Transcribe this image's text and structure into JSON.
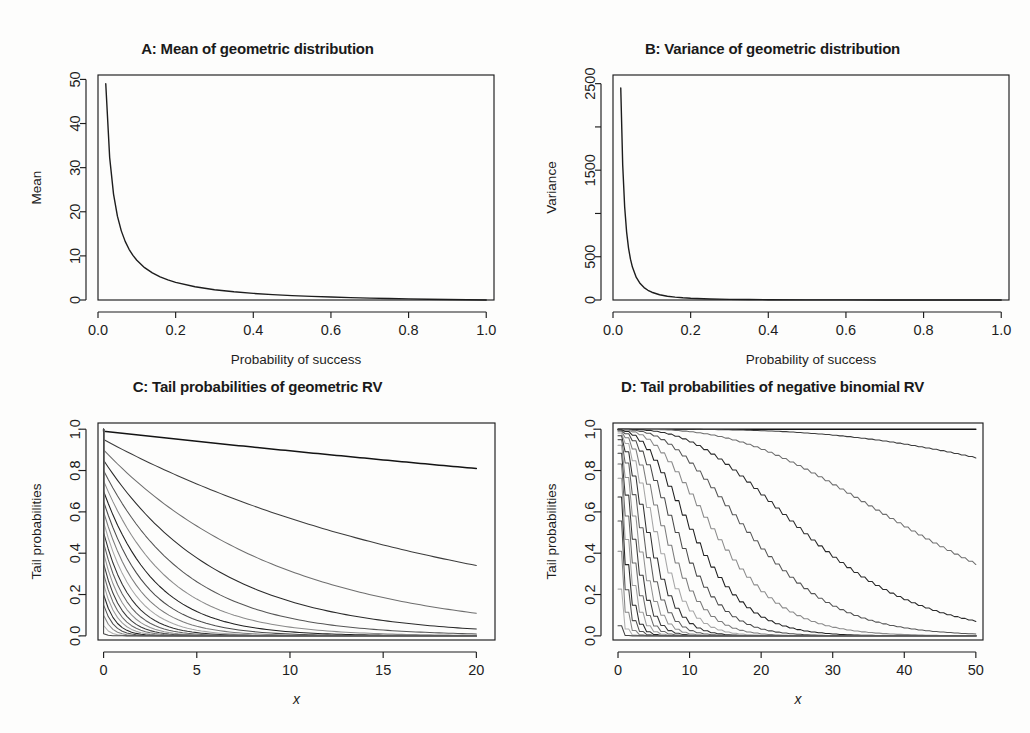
{
  "figure": {
    "background": "#fdfdfc",
    "foreground": "#1d1d1d",
    "width": 1030,
    "height": 733
  },
  "panels": [
    {
      "id": "A",
      "title": "A: Mean of geometric distribution",
      "xlabel": "Probability of success",
      "ylabel": "Mean"
    },
    {
      "id": "B",
      "title": "B: Variance of geometric distribution",
      "xlabel": "Probability of success",
      "ylabel": "Variance"
    },
    {
      "id": "C",
      "title": "C: Tail probabilities of geometric RV",
      "xlabel": "x",
      "ylabel": "Tail probabilities"
    },
    {
      "id": "D",
      "title": "D: Tail probabilities of negative binomial RV",
      "xlabel": "x",
      "ylabel": "Tail probabilities"
    }
  ],
  "chart_data": [
    {
      "panel": "A",
      "type": "line",
      "title": "A: Mean of geometric distribution",
      "xlabel": "Probability of success",
      "ylabel": "Mean",
      "xlim": [
        0.0,
        1.02
      ],
      "ylim": [
        0.0,
        51.0
      ],
      "xticks": [
        0.0,
        0.2,
        0.4,
        0.6,
        0.8,
        1.0
      ],
      "xticklabels": [
        "0.0",
        "0.2",
        "0.4",
        "0.6",
        "0.8",
        "1.0"
      ],
      "yticks": [
        0,
        10,
        20,
        30,
        40,
        50
      ],
      "yticklabels": [
        "0",
        "10",
        "20",
        "30",
        "40",
        "50"
      ],
      "grid": false,
      "legend": false,
      "formula": "mean = (1-p)/p",
      "series": [
        {
          "name": "mean of geometric",
          "color": "#1d1d1d",
          "width": 1.4,
          "x": [
            0.02,
            0.03,
            0.04,
            0.05,
            0.06,
            0.07,
            0.08,
            0.09,
            0.1,
            0.12,
            0.14,
            0.16,
            0.18,
            0.2,
            0.25,
            0.3,
            0.35,
            0.4,
            0.45,
            0.5,
            0.55,
            0.6,
            0.65,
            0.7,
            0.75,
            0.8,
            0.85,
            0.9,
            0.95,
            1.0
          ],
          "y": [
            49.0,
            32.33,
            24.0,
            19.0,
            15.67,
            13.29,
            11.5,
            10.11,
            9.0,
            7.33,
            6.14,
            5.25,
            4.56,
            4.0,
            3.0,
            2.33,
            1.857,
            1.5,
            1.222,
            1.0,
            0.818,
            0.667,
            0.538,
            0.429,
            0.333,
            0.25,
            0.176,
            0.111,
            0.053,
            0.0
          ]
        }
      ]
    },
    {
      "panel": "B",
      "type": "line",
      "title": "B: Variance of geometric distribution",
      "xlabel": "Probability of success",
      "ylabel": "Variance",
      "xlim": [
        0.0,
        1.02
      ],
      "ylim": [
        0.0,
        2600.0
      ],
      "xticks": [
        0.0,
        0.2,
        0.4,
        0.6,
        0.8,
        1.0
      ],
      "xticklabels": [
        "0.0",
        "0.2",
        "0.4",
        "0.6",
        "0.8",
        "1.0"
      ],
      "yticks": [
        0,
        500,
        1000,
        1500,
        2000,
        2500
      ],
      "yticklabels": [
        "0",
        "500",
        "",
        "1500",
        "",
        "2500"
      ],
      "grid": false,
      "legend": false,
      "formula": "variance = (1-p)/p^2",
      "series": [
        {
          "name": "variance of geometric",
          "color": "#1d1d1d",
          "width": 1.4,
          "x": [
            0.02,
            0.025,
            0.03,
            0.035,
            0.04,
            0.045,
            0.05,
            0.06,
            0.07,
            0.08,
            0.09,
            0.1,
            0.12,
            0.14,
            0.16,
            0.18,
            0.2,
            0.25,
            0.3,
            0.35,
            0.4,
            0.5,
            0.6,
            0.7,
            0.8,
            0.9,
            1.0
          ],
          "y": [
            2450.0,
            1560.0,
            1077.8,
            787.8,
            600.0,
            471.6,
            380.0,
            261.1,
            189.8,
            143.8,
            112.3,
            90.0,
            61.1,
            43.9,
            32.8,
            25.3,
            20.0,
            12.0,
            7.78,
            5.31,
            3.75,
            2.0,
            1.11,
            0.61,
            0.31,
            0.12,
            0.0
          ]
        }
      ]
    },
    {
      "panel": "C",
      "type": "line",
      "title": "C: Tail probabilities of geometric RV",
      "xlabel": "x",
      "ylabel": "Tail probabilities",
      "xlim": [
        -0.3,
        21.0
      ],
      "ylim": [
        -0.02,
        1.03
      ],
      "xticks": [
        0,
        5,
        10,
        15,
        20
      ],
      "xticklabels": [
        "0",
        "5",
        "10",
        "15",
        "20"
      ],
      "yticks": [
        0.0,
        0.2,
        0.4,
        0.6,
        0.8,
        1.0
      ],
      "yticklabels": [
        "0.0",
        "0.2",
        "0.4",
        "0.6",
        "0.8",
        "1.0"
      ],
      "grid": false,
      "legend": false,
      "formula": "P(X > x) = (1-p)^(x+1)",
      "note": "One curve per probability of success p; greyscale shading varies by p.",
      "p_values": [
        0.01,
        0.05,
        0.1,
        0.15,
        0.2,
        0.25,
        0.3,
        0.35,
        0.4,
        0.45,
        0.5,
        0.55,
        0.6,
        0.65,
        0.7,
        0.75,
        0.8,
        0.85,
        0.9,
        0.95,
        0.99
      ],
      "x_values": [
        0,
        1,
        2,
        3,
        4,
        5,
        6,
        7,
        8,
        9,
        10,
        11,
        12,
        13,
        14,
        15,
        16,
        17,
        18,
        19,
        20
      ],
      "greys": [
        "#141414",
        "#3c3c3c",
        "#6e6e6e",
        "#2a2a2a",
        "#555555",
        "#8a8a8a",
        "#1f1f1f",
        "#494949",
        "#7b7b7b",
        "#a6a6a6",
        "#2f2f2f",
        "#5e5e5e",
        "#909090",
        "#3a3a3a",
        "#686868",
        "#9c9c9c",
        "#262626",
        "#505050",
        "#848484",
        "#b0b0b0",
        "#444444"
      ]
    },
    {
      "panel": "D",
      "type": "line",
      "title": "D: Tail probabilities of negative binomial RV",
      "xlabel": "x",
      "ylabel": "Tail probabilities",
      "xlim": [
        -0.7,
        51.0
      ],
      "ylim": [
        -0.02,
        1.03
      ],
      "xticks": [
        0,
        10,
        20,
        30,
        40,
        50
      ],
      "xticklabels": [
        "0",
        "10",
        "20",
        "30",
        "40",
        "50"
      ],
      "yticks": [
        0.0,
        0.2,
        0.4,
        0.6,
        0.8,
        1.0
      ],
      "yticklabels": [
        "0.0",
        "0.2",
        "0.4",
        "0.6",
        "0.8",
        "1.0"
      ],
      "grid": false,
      "legend": false,
      "formula": "P(X > x) for negative binomial with size r = 5",
      "note": "One S-shaped curve per probability of success p; greyscale shading varies by p.",
      "size_r": 5,
      "p_values": [
        0.01,
        0.05,
        0.1,
        0.15,
        0.2,
        0.25,
        0.3,
        0.35,
        0.4,
        0.45,
        0.5,
        0.55,
        0.6,
        0.65,
        0.7,
        0.75,
        0.8,
        0.85,
        0.9,
        0.95,
        0.99
      ],
      "greys": [
        "#141414",
        "#3c3c3c",
        "#6e6e6e",
        "#2a2a2a",
        "#555555",
        "#8a8a8a",
        "#1f1f1f",
        "#494949",
        "#7b7b7b",
        "#a6a6a6",
        "#2f2f2f",
        "#5e5e5e",
        "#909090",
        "#3a3a3a",
        "#686868",
        "#9c9c9c",
        "#262626",
        "#505050",
        "#848484",
        "#b0b0b0",
        "#444444"
      ]
    }
  ]
}
